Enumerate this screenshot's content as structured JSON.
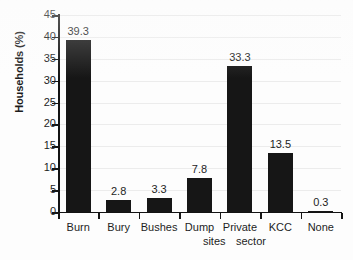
{
  "chart_data": {
    "type": "bar",
    "title": "",
    "subtitle": "",
    "xlabel": "",
    "ylabel": "Households (%)",
    "ylim": [
      0,
      45
    ],
    "ytick_step": 5,
    "ytick_labels": [
      "45",
      "40",
      "35",
      "30",
      "25",
      "20",
      "15",
      "10",
      "5",
      "0"
    ],
    "grid": true,
    "grid_axis": "y",
    "legend": false,
    "legend_position": "none",
    "categories": [
      "Burn",
      "Bury",
      "Bushes",
      "Dump sites",
      "Private sector",
      "KCC",
      "None"
    ],
    "values": [
      39.3,
      2.8,
      3.3,
      7.8,
      33.3,
      13.5,
      0.3
    ],
    "data_labels": [
      "39.3",
      "2.8",
      "3.3",
      "7.8",
      "33.3",
      "13.5",
      "0.3"
    ],
    "category_label_lines": [
      [
        "Burn"
      ],
      [
        "Bury"
      ],
      [
        "Bushes"
      ],
      [
        "Dump",
        "sites"
      ],
      [
        "Private",
        "sector"
      ],
      [
        "KCC"
      ],
      [
        "None"
      ]
    ],
    "colors": {
      "bar": "#161616",
      "axis": "#131313",
      "gridline": "#ececec",
      "text": "#1d1d1d",
      "background": "#fdfdfd"
    }
  }
}
